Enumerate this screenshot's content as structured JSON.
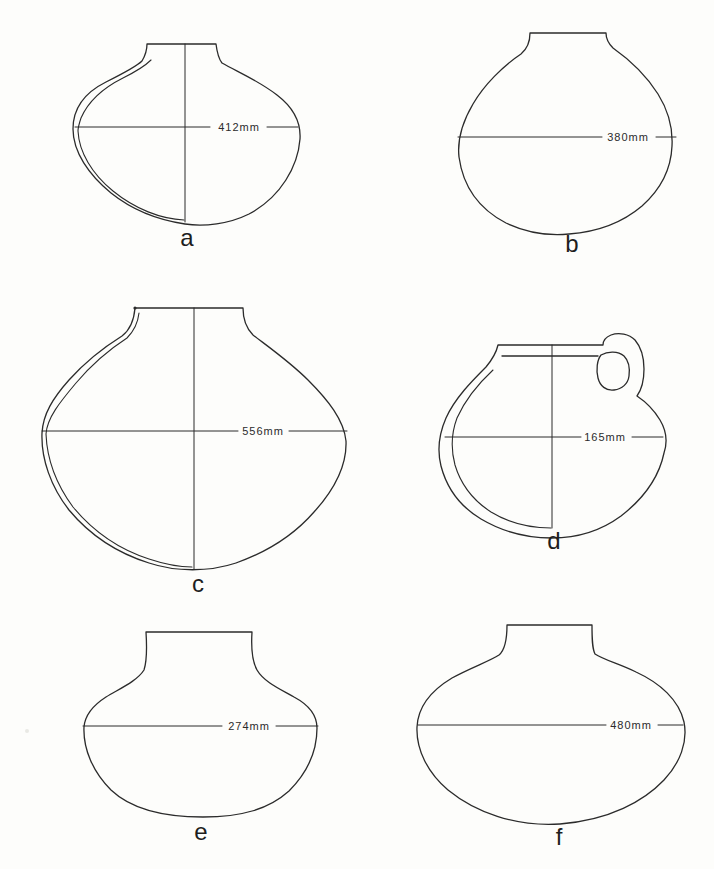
{
  "figure": {
    "type": "archaeological-vessel-profiles",
    "background_color": "#fdfdfb",
    "line_color": "#2b2b2b",
    "vessels": [
      {
        "id": "a",
        "label": "a",
        "diameter_label": "412mm",
        "has_vertical_axis": true,
        "has_wall_section": true,
        "has_handle": false
      },
      {
        "id": "b",
        "label": "b",
        "diameter_label": "380mm",
        "has_vertical_axis": false,
        "has_wall_section": false,
        "has_handle": false
      },
      {
        "id": "c",
        "label": "c",
        "diameter_label": "556mm",
        "has_vertical_axis": true,
        "has_wall_section": true,
        "has_handle": false
      },
      {
        "id": "d",
        "label": "d",
        "diameter_label": "165mm",
        "has_vertical_axis": true,
        "has_wall_section": true,
        "has_handle": true
      },
      {
        "id": "e",
        "label": "e",
        "diameter_label": "274mm",
        "has_vertical_axis": false,
        "has_wall_section": false,
        "has_handle": false
      },
      {
        "id": "f",
        "label": "f",
        "diameter_label": "480mm",
        "has_vertical_axis": false,
        "has_wall_section": false,
        "has_handle": false
      }
    ]
  }
}
